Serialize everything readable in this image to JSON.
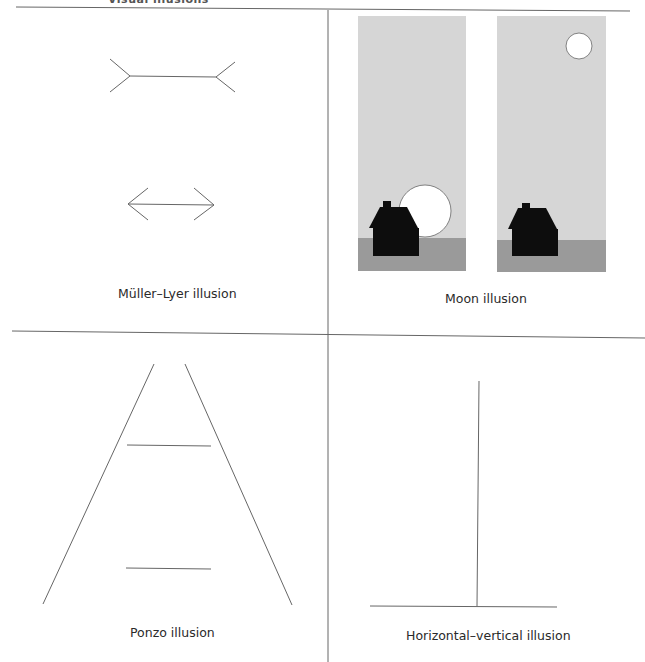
{
  "header": {
    "title_clipped": "Visual illusions"
  },
  "panels": [
    {
      "id": "muller-lyer",
      "caption": "Müller–Lyer illusion"
    },
    {
      "id": "moon",
      "caption": "Moon illusion"
    },
    {
      "id": "ponzo",
      "caption": "Ponzo illusion"
    },
    {
      "id": "horizontal-vertical",
      "caption": "Horizontal–vertical illusion"
    }
  ],
  "colors": {
    "line": "#555555",
    "sky": "#d6d6d6",
    "ground": "#9a9a9a",
    "house": "#0d0d0d",
    "moon": "#ffffff",
    "divider": "#666666"
  }
}
